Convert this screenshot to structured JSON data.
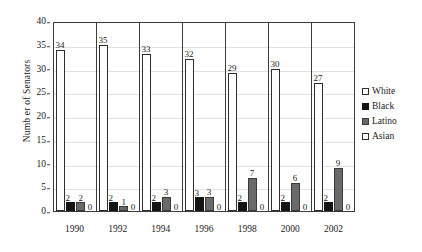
{
  "chart_data": {
    "type": "bar",
    "title": "",
    "subtitle": "",
    "xlabel": "",
    "ylabel": "Numb er of Senators",
    "categories": [
      "1990",
      "1992",
      "1994",
      "1996",
      "1998",
      "2000",
      "2002"
    ],
    "series": [
      {
        "name": "White",
        "values": [
          34,
          35,
          33,
          32,
          29,
          30,
          27
        ],
        "color": "#ffffff",
        "border": "#2e2e2e"
      },
      {
        "name": "Black",
        "values": [
          2,
          2,
          2,
          3,
          2,
          2,
          2
        ],
        "color": "#141414",
        "border": "#141414"
      },
      {
        "name": "Latino",
        "values": [
          2,
          1,
          3,
          3,
          7,
          6,
          9
        ],
        "color": "#6a6a6a",
        "border": "#3a3a3a"
      },
      {
        "name": "Asian",
        "values": [
          0,
          0,
          0,
          0,
          0,
          0,
          0
        ],
        "color": "#ffffff",
        "border": "#2e2e2e"
      }
    ],
    "ylim": [
      0,
      40
    ],
    "yticks": [
      0,
      5,
      10,
      15,
      20,
      25,
      30,
      35,
      40
    ],
    "grid": true,
    "legend_position": "right",
    "data_labels": true
  },
  "legend": {
    "items": [
      {
        "label": "White",
        "marker": "square-outline-icon"
      },
      {
        "label": "Black",
        "marker": "square-filled-black-icon"
      },
      {
        "label": "Latino",
        "marker": "square-filled-gray-icon"
      },
      {
        "label": "Asian",
        "marker": "square-outline-icon"
      }
    ]
  }
}
